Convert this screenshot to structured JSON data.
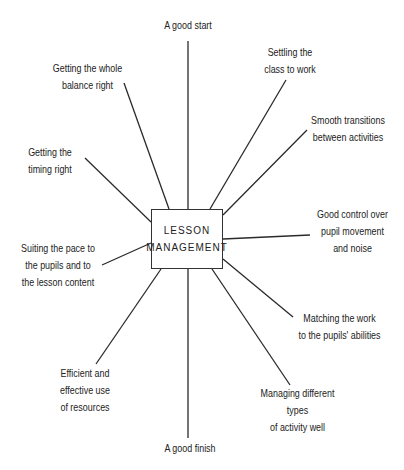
{
  "center": {
    "line1": "LESSON",
    "line2": "MANAGEMENT"
  },
  "branches": [
    {
      "id": "good-start",
      "text": "A good start"
    },
    {
      "id": "settling",
      "text": "Settling the\nclass to work"
    },
    {
      "id": "transitions",
      "text": "Smooth transitions\nbetween activities"
    },
    {
      "id": "control",
      "text": "Good control over\npupil movement\nand noise"
    },
    {
      "id": "matching",
      "text": "Matching the work\nto the pupils' abilities"
    },
    {
      "id": "activity-types",
      "text": "Managing different\ntypes\nof activity well"
    },
    {
      "id": "good-finish",
      "text": "A good finish"
    },
    {
      "id": "resources",
      "text": "Efficient and\neffective use\nof resources"
    },
    {
      "id": "pace",
      "text": "Suiting the pace to\nthe pupils and to\nthe lesson content"
    },
    {
      "id": "timing",
      "text": "Getting the\ntiming right"
    },
    {
      "id": "balance",
      "text": "Getting the whole\nbalance right"
    }
  ]
}
